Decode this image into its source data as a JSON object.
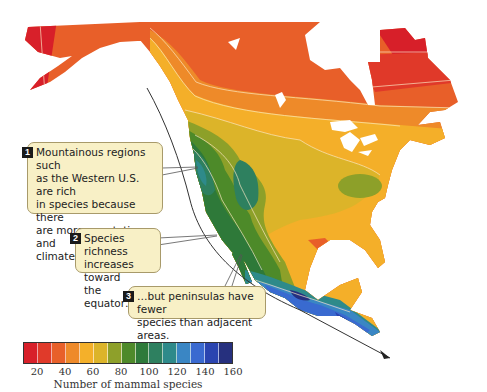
{
  "map": {
    "title": "Mammal species richness in North America",
    "region": "North America"
  },
  "callouts": [
    {
      "number": "1",
      "lines": [
        "Mountainous regions such",
        "as the Western U.S. are rich",
        "in species because there",
        "are more vegetation and",
        "climate types."
      ]
    },
    {
      "number": "2",
      "lines": [
        "Species richness",
        "increases toward",
        "the equator…"
      ]
    },
    {
      "number": "3",
      "lines": [
        "…but peninsulas have fewer",
        "species than adjacent areas."
      ]
    }
  ],
  "legend": {
    "title": "Number of mammal species",
    "ticks": [
      "20",
      "40",
      "60",
      "80",
      "100",
      "120",
      "140",
      "160"
    ],
    "colors": [
      "#d8202a",
      "#e03a2a",
      "#e8602a",
      "#ee8a2a",
      "#f4b02a",
      "#dcb42a",
      "#8ea02a",
      "#4e8a2a",
      "#2e7a3a",
      "#2e8060",
      "#2e8a8a",
      "#3a86c4",
      "#3a6ad0",
      "#2a44b0",
      "#26307e"
    ]
  }
}
